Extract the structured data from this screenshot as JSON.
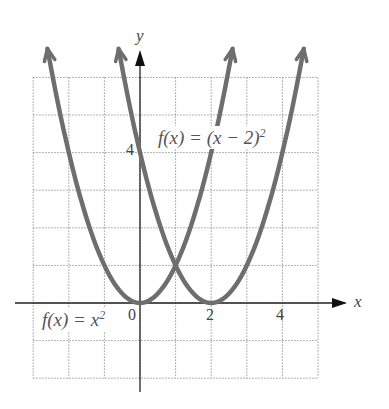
{
  "chart_data": {
    "type": "line",
    "title": "",
    "xlabel": "x",
    "ylabel": "y",
    "xlim": [
      -3,
      5
    ],
    "ylim": [
      -2,
      6
    ],
    "grid": true,
    "grid_style": "dotted",
    "x_tick_labels": [
      "0",
      "2",
      "4"
    ],
    "y_tick_labels": [
      "4"
    ],
    "series": [
      {
        "name": "f(x) = x^2",
        "x": [
          -2.6,
          -2,
          -1,
          0,
          1,
          2,
          2.6
        ],
        "values": [
          6.76,
          4,
          1,
          0,
          1,
          4,
          6.76
        ]
      },
      {
        "name": "f(x) = (x - 2)^2",
        "x": [
          -0.6,
          0,
          1,
          2,
          3,
          4,
          4.6
        ],
        "values": [
          6.76,
          4,
          1,
          0,
          1,
          4,
          6.76
        ]
      }
    ],
    "annotations": [
      "f(x) = (x − 2)²",
      "f(x) = x²"
    ],
    "intersection": [
      1,
      1
    ]
  },
  "labels": {
    "y_axis": "y",
    "x_axis": "x",
    "origin": "0",
    "tick_x2": "2",
    "tick_x4": "4",
    "tick_y4": "4",
    "eq1_main": "f(x) = (x − 2)",
    "eq1_exp": "2",
    "eq2_main": "f(x) = x",
    "eq2_exp": "2"
  },
  "colors": {
    "curve": "#6e6e6e",
    "axis": "#222222",
    "grid": "#9a9a9a"
  }
}
